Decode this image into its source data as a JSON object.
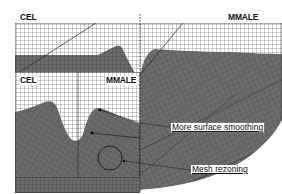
{
  "figure": {
    "type": "mesh-comparison-diagram",
    "panels": {
      "main": {
        "left_label": "CEL",
        "right_label": "MMALE"
      },
      "inset": {
        "left_label": "CEL",
        "right_label": "MMALE"
      }
    },
    "annotations": [
      {
        "text": "More surface smoothing"
      },
      {
        "text": "Mesh rezoning"
      }
    ],
    "colors": {
      "material": "#6a6a6a",
      "material_dark": "#555555",
      "grid_line": "#2a2a2a",
      "void": "#ffffff",
      "background": "#ffffff"
    }
  }
}
